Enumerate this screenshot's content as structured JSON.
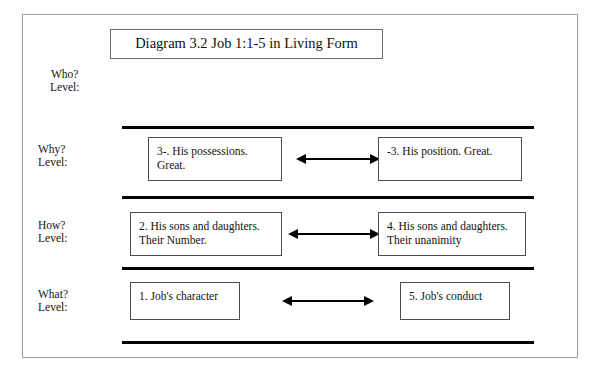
{
  "document": {
    "title": "Diagram 3.2 Job 1:1-5 in Living Form"
  },
  "rows": [
    {
      "id": "who",
      "label_line1": "Who?",
      "label_line2": "Level:",
      "left_box": null,
      "right_box": null,
      "arrow": null
    },
    {
      "id": "why",
      "label_line1": "Why?",
      "label_line2": "Level:",
      "left_box": {
        "line1": "3-. His possessions.",
        "line2": "Great."
      },
      "right_box": {
        "line1": "-3. His position. Great.",
        "line2": ""
      },
      "arrow": "double-headed-arrow"
    },
    {
      "id": "how",
      "label_line1": "How?",
      "label_line2": "Level:",
      "left_box": {
        "line1": "2. His sons and daughters.",
        "line2": "Their Number."
      },
      "right_box": {
        "line1": "4. His sons and daughters.",
        "line2": "Their unanimity"
      },
      "arrow": "double-headed-arrow"
    },
    {
      "id": "what",
      "label_line1": "What?",
      "label_line2": "Level:",
      "left_box": {
        "line1": "1. Job's character",
        "line2": ""
      },
      "right_box": {
        "line1": "5. Job's conduct",
        "line2": ""
      },
      "arrow": "double-headed-arrow"
    }
  ],
  "rules": {
    "count": 4,
    "color": "#000000"
  },
  "colors": {
    "ink": "#111111",
    "frame": "#9a9a9a",
    "box_border": "#4d4d4d",
    "rule": "#000000",
    "background": "#ffffff"
  }
}
